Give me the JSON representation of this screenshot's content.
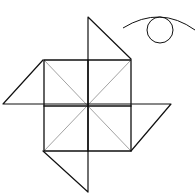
{
  "diagram": {
    "type": "line-drawing",
    "stroke_color": "#111111",
    "thin_stroke_color": "#888888",
    "background": "#ffffff",
    "elements": [
      {
        "name": "pinwheel",
        "parts": [
          "central-square-2x2-grid",
          "diagonals",
          "top-flap",
          "left-flap",
          "right-flap",
          "bottom-flap"
        ]
      },
      {
        "name": "eye-symbol",
        "parts": [
          "eyelid-arc",
          "iris-circle"
        ]
      }
    ]
  }
}
